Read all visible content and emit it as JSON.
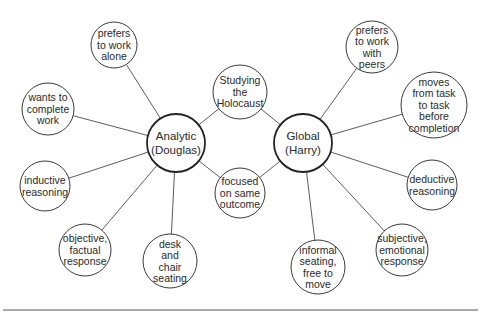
{
  "diagram": {
    "centers": [
      {
        "id": "analytic",
        "lines": [
          "Analytic",
          "(Douglas)"
        ],
        "cx": 176,
        "cy": 143,
        "r": 29
      },
      {
        "id": "global",
        "lines": [
          "Global",
          "(Harry)"
        ],
        "cx": 303,
        "cy": 143,
        "r": 29
      }
    ],
    "shared": [
      {
        "id": "holocaust",
        "lines": [
          "Studying",
          "the",
          "Holocaust"
        ],
        "cx": 240,
        "cy": 92,
        "r": 27
      },
      {
        "id": "focused",
        "lines": [
          "focused",
          "on same",
          "outcome"
        ],
        "cx": 240,
        "cy": 193,
        "r": 25
      }
    ],
    "analytic_traits": [
      {
        "id": "prefers-alone",
        "lines": [
          "prefers",
          "to work",
          "alone"
        ],
        "cx": 114,
        "cy": 45,
        "r": 23
      },
      {
        "id": "complete-work",
        "lines": [
          "wants to",
          "complete",
          "work"
        ],
        "cx": 48,
        "cy": 109,
        "r": 26
      },
      {
        "id": "inductive",
        "lines": [
          "inductive",
          "reasoning"
        ],
        "cx": 45,
        "cy": 186,
        "r": 25
      },
      {
        "id": "objective",
        "lines": [
          "objective,",
          "factual",
          "response"
        ],
        "cx": 85,
        "cy": 250,
        "r": 26
      },
      {
        "id": "desk-chair",
        "lines": [
          "desk",
          "and",
          "chair",
          "seating"
        ],
        "cx": 170,
        "cy": 261,
        "r": 27
      }
    ],
    "global_traits": [
      {
        "id": "prefers-peers",
        "lines": [
          "prefers",
          "to work",
          "with",
          "peers"
        ],
        "cx": 372,
        "cy": 47,
        "r": 26
      },
      {
        "id": "task-to-task",
        "lines": [
          "moves",
          "from task",
          "to task",
          "before",
          "completion"
        ],
        "cx": 434,
        "cy": 105,
        "r": 33
      },
      {
        "id": "deductive",
        "lines": [
          "deductive",
          "reasoning"
        ],
        "cx": 432,
        "cy": 185,
        "r": 25
      },
      {
        "id": "subjective",
        "lines": [
          "subjective,",
          "emotional",
          "response"
        ],
        "cx": 402,
        "cy": 250,
        "r": 26
      },
      {
        "id": "informal-seating",
        "lines": [
          "informal",
          "seating,",
          "free to",
          "move"
        ],
        "cx": 318,
        "cy": 267,
        "r": 27
      }
    ],
    "colors": {
      "stroke": "#3a3a3a",
      "text": "#2a2a2a",
      "background": "#ffffff"
    },
    "rule": {
      "x1": 3,
      "x2": 478,
      "y": 310
    }
  }
}
